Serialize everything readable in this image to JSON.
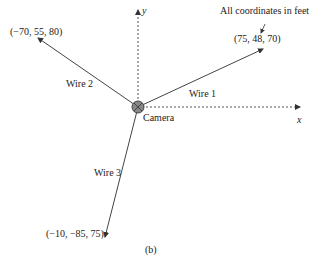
{
  "figure": {
    "caption": "(b)",
    "note": "All coordinates in feet",
    "axes": {
      "x_label": "x",
      "y_label": "y"
    },
    "camera": {
      "label": "Camera"
    },
    "wires": [
      {
        "label": "Wire 1",
        "endpoint": "(75, 48, 70)"
      },
      {
        "label": "Wire 2",
        "endpoint": "(−70, 55, 80)"
      },
      {
        "label": "Wire 3",
        "endpoint": "(−10, −85, 75)"
      }
    ]
  },
  "colors": {
    "line": "#444444",
    "axis": "#555555",
    "camera": "#777777"
  }
}
